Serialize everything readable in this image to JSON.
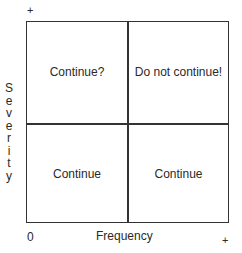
{
  "diagram": {
    "type": "risk-matrix",
    "x_axis": {
      "label": "Frequency",
      "min_label": "0",
      "max_label": "+"
    },
    "y_axis": {
      "label": "Severity",
      "label_vertical": "S\ne\nv\ne\nr\ni\nt\ny",
      "max_label": "+"
    },
    "quadrants": {
      "top_left": "Continue?",
      "top_right": "Do not continue!",
      "bottom_left": "Continue",
      "bottom_right": "Continue"
    },
    "colors": {
      "line": "#333333",
      "text": "#2a2a2a",
      "background": "#ffffff"
    }
  }
}
